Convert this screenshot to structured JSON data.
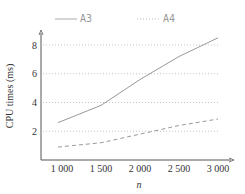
{
  "chart_data": {
    "type": "line",
    "title": "",
    "xlabel": "n",
    "ylabel": "CPU times (ms)",
    "x": [
      1000,
      1500,
      2000,
      2500,
      3000
    ],
    "x_tick_labels": [
      "1 000",
      "1 500",
      "2 000",
      "2 500",
      "3 000"
    ],
    "y_ticks": [
      2,
      4,
      6,
      8
    ],
    "y_tick_labels": [
      "2",
      "4",
      "6",
      "8"
    ],
    "xlim": [
      800,
      3200
    ],
    "ylim": [
      0,
      9
    ],
    "grid": "horizontal dotted",
    "legend_position": "top",
    "series": [
      {
        "name": "A3",
        "style": "solid",
        "color": "#999999",
        "values": [
          2.6,
          3.8,
          5.6,
          7.2,
          8.5
        ]
      },
      {
        "name": "A4",
        "style": "dashed",
        "color": "#999999",
        "values": [
          0.9,
          1.2,
          1.8,
          2.4,
          2.85
        ]
      }
    ]
  },
  "legend": {
    "items": [
      {
        "label": "A3",
        "style": "solid"
      },
      {
        "label": "A4",
        "style": "dotted"
      }
    ]
  }
}
